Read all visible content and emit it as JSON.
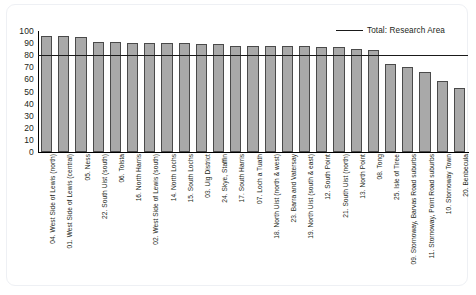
{
  "chart_data": {
    "type": "bar",
    "title": "",
    "xlabel": "",
    "ylabel": "",
    "ylim": [
      0,
      100
    ],
    "ytick_step": 10,
    "yticks": [
      100,
      90,
      80,
      70,
      60,
      50,
      40,
      30,
      20,
      10,
      0
    ],
    "grid": false,
    "legend_position": "top-right",
    "legend": [
      "Total: Research Area"
    ],
    "bar_color": "#a9a9a9",
    "bar_edge_color": "#4a4a4a",
    "reference_line": {
      "label": "Total: Research Area",
      "value": 80,
      "color": "#1a1a1a"
    },
    "categories": [
      "04. West Side of Lewis (north)",
      "01. West Side of Lewis (central)",
      "05. Ness",
      "22. South Uist (south)",
      "06. Tolsta",
      "16. North Harris",
      "02. West Side of Lewis (south)",
      "14. North Lochs",
      "15. South Lochs",
      "03. Uig District",
      "24. Skye, Staffin",
      "17. South Harris",
      "07. Loch a Tuath",
      "18. North Uist (north & west)",
      "23. Barra and Vatersay",
      "19. North Uist (south & east)",
      "12. South Point",
      "21. South Uist (north)",
      "13. North Point",
      "08. Tong",
      "25. Isle of Tiree",
      "09. Stornoway, Barvas Road suburbs",
      "11. Stornoway, Point Road suburbs",
      "10. Stornoway Town",
      "20. Benbecula"
    ],
    "values": [
      96,
      96,
      95,
      91,
      91,
      90,
      90,
      90,
      90,
      89,
      89,
      88,
      88,
      88,
      88,
      88,
      87,
      87,
      85,
      84,
      73,
      70,
      66,
      59,
      53
    ]
  },
  "caption": {
    "text": ""
  }
}
